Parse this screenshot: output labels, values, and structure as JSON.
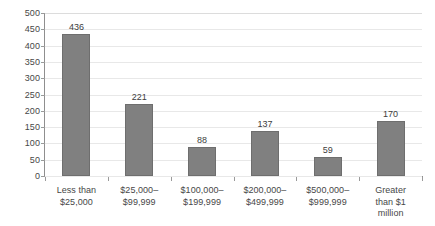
{
  "chart_data": {
    "type": "bar",
    "title": "",
    "subtitle": "",
    "xlabel": "",
    "ylabel": "",
    "categories": [
      "Less than\n$25,000",
      "$25,000–\n$99,999",
      "$100,000–\n$199,999",
      "$200,000–\n$499,999",
      "$500,000–\n$999,999",
      "Greater\nthan $1\nmillion"
    ],
    "values": [
      436,
      221,
      88,
      137,
      59,
      170
    ],
    "value_labels": [
      "436",
      "221",
      "88",
      "137",
      "59",
      "170"
    ],
    "ylim": [
      0,
      500
    ],
    "ytick_step": 50,
    "ytick_labels": [
      "0",
      "50",
      "100",
      "150",
      "200",
      "250",
      "300",
      "350",
      "400",
      "450",
      "500"
    ],
    "grid": true,
    "grid_axis": "y",
    "legend": false,
    "legend_position": "none",
    "colors": {
      "bar_fill": "#808080",
      "bar_border": "#6e6e6e",
      "gridline": "#e8e8e8",
      "axis_line": "#8f8f8f",
      "text": "#474747",
      "background": "#ffffff"
    }
  }
}
